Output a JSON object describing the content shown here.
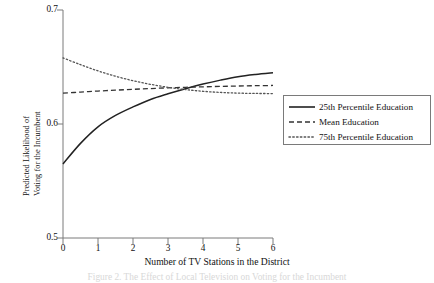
{
  "chart_data": {
    "type": "line",
    "title": "",
    "xlabel": "Number of TV Stations in the District",
    "ylabel": "Predicted Likelihood of Voting for the Incumbent",
    "ylabel_line1": "Predicted Likelihood of",
    "ylabel_line2": "Voting for the Incumbent",
    "xlim": [
      0,
      6
    ],
    "ylim": [
      0.5,
      0.7
    ],
    "xticks": [
      0,
      1,
      2,
      3,
      4,
      5,
      6
    ],
    "xtick_labels": [
      "0",
      "1",
      "2",
      "3",
      "4",
      "5",
      "6"
    ],
    "yticks": [
      0.5,
      0.6,
      0.7
    ],
    "ytick_labels": [
      "0.5",
      "0.6",
      "0.7"
    ],
    "grid": false,
    "legend_position": "right-center",
    "x": [
      0,
      0.5,
      1,
      1.5,
      2,
      2.5,
      3,
      3.5,
      4,
      4.5,
      5,
      5.5,
      6
    ],
    "series": [
      {
        "name": "25th Percentile Education",
        "style": "solid",
        "color": "#222222",
        "values": [
          0.565,
          0.583,
          0.5975,
          0.6075,
          0.615,
          0.6215,
          0.6265,
          0.631,
          0.635,
          0.6385,
          0.6415,
          0.6435,
          0.645
        ]
      },
      {
        "name": "Mean Education",
        "style": "dashed",
        "color": "#333333",
        "values": [
          0.627,
          0.628,
          0.6289,
          0.6297,
          0.6304,
          0.6311,
          0.6317,
          0.6322,
          0.6326,
          0.633,
          0.6333,
          0.6336,
          0.6338
        ]
      },
      {
        "name": "75th Percentile Education",
        "style": "dotted",
        "color": "#555555",
        "values": [
          0.658,
          0.652,
          0.6466,
          0.6419,
          0.638,
          0.6348,
          0.6322,
          0.6302,
          0.6287,
          0.6277,
          0.6271,
          0.6268,
          0.6267
        ]
      }
    ],
    "legend": [
      {
        "label": "25th Percentile Education",
        "style": "solid"
      },
      {
        "label": "Mean Education",
        "style": "dashed"
      },
      {
        "label": "75th Percentile Education",
        "style": "dotted"
      }
    ],
    "caption": "Figure 2.  The Effect of Local Television on Voting for the Incumbent"
  },
  "axes": {
    "axis_color": "#7a7a7a",
    "plot_left_px": 63,
    "plot_right_px": 273,
    "plot_top_px": 10,
    "plot_bottom_px": 238
  }
}
